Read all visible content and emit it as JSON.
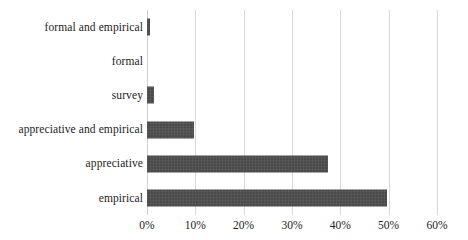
{
  "chart_data": {
    "type": "bar",
    "orientation": "horizontal",
    "title": "",
    "subtitle": "",
    "xlabel": "",
    "ylabel": "",
    "categories": [
      "formal and empirical",
      "formal",
      "survey",
      "appreciative and empirical",
      "appreciative",
      "empirical"
    ],
    "values": [
      0.6,
      0.0,
      1.5,
      9.7,
      37.5,
      49.6
    ],
    "value_unit": "%",
    "xlim": [
      0,
      60
    ],
    "x_tick_labels": [
      "0%",
      "10%",
      "20%",
      "30%",
      "40%",
      "50%",
      "60%"
    ],
    "x_tick_values": [
      0,
      10,
      20,
      30,
      40,
      50,
      60
    ],
    "grid": true,
    "grid_axis": "x",
    "legend": false,
    "legend_position": "none",
    "series": [
      {
        "name": "",
        "values": [
          0.6,
          0.0,
          1.5,
          9.7,
          37.5,
          49.6
        ]
      }
    ],
    "colors": {
      "bar": "#4a4a4a",
      "gridline": "#d9d9d9",
      "background": "#ffffff",
      "text": "#1c1c1c"
    }
  }
}
